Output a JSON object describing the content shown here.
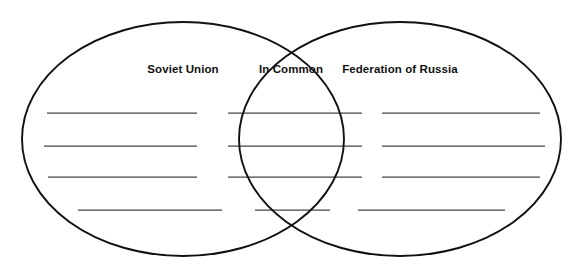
{
  "diagram": {
    "type": "venn-two-set",
    "canvas": {
      "width": 581,
      "height": 268,
      "background": "#ffffff"
    },
    "stroke_color": "#111111",
    "rule_color": "#444444",
    "regions": [
      {
        "id": "left",
        "label": "Soviet Union",
        "label_x": 183,
        "label_y": 70,
        "line_count": 4
      },
      {
        "id": "overlap",
        "label": "In Common",
        "label_x": 291,
        "label_y": 70,
        "line_count": 4
      },
      {
        "id": "right",
        "label": "Federation of Russia",
        "label_x": 400,
        "label_y": 70,
        "line_count": 4
      }
    ],
    "ellipses": [
      {
        "id": "left-ellipse",
        "cx": 183,
        "cy": 139,
        "rx": 161,
        "ry": 117
      },
      {
        "id": "right-ellipse",
        "cx": 400,
        "cy": 139,
        "rx": 161,
        "ry": 117
      }
    ],
    "rule_rows": [
      {
        "row": 1,
        "y": 113,
        "left": {
          "x1": 47,
          "x2": 197
        },
        "overlap": {
          "x1": 228,
          "x2": 362
        },
        "right": {
          "x1": 382,
          "x2": 540
        }
      },
      {
        "row": 2,
        "y": 146,
        "left": {
          "x1": 44,
          "x2": 197
        },
        "overlap": {
          "x1": 228,
          "x2": 362
        },
        "right": {
          "x1": 382,
          "x2": 545
        }
      },
      {
        "row": 3,
        "y": 177,
        "left": {
          "x1": 48,
          "x2": 197
        },
        "overlap": {
          "x1": 228,
          "x2": 362
        },
        "right": {
          "x1": 382,
          "x2": 540
        }
      },
      {
        "row": 4,
        "y": 210,
        "left": {
          "x1": 78,
          "x2": 222
        },
        "overlap": {
          "x1": 255,
          "x2": 330
        },
        "right": {
          "x1": 358,
          "x2": 505
        }
      }
    ]
  }
}
